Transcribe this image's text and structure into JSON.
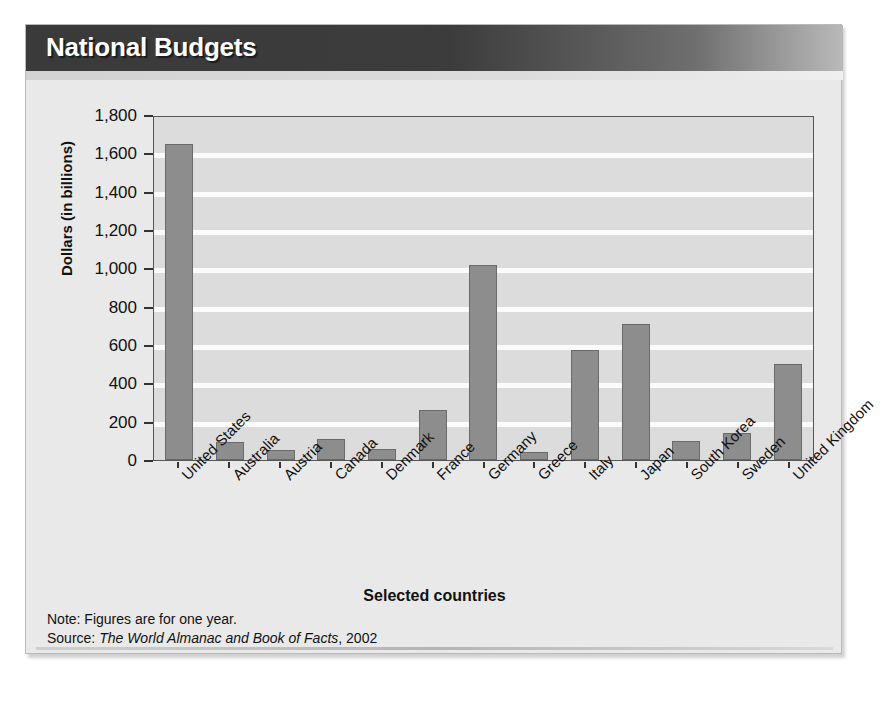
{
  "figure": {
    "title": "National Budgets",
    "notes": [
      {
        "label": "Note:",
        "text": "Figures are for one year."
      }
    ],
    "source": {
      "label": "Source:",
      "italic_title": "The World Almanac and Book of Facts",
      "year": ", 2002"
    },
    "colors": {
      "bar_fill": "#8d8d8d",
      "bar_edge": "#6a6a6a",
      "plot_background": "#dcdcdc",
      "gridline": "#fbfbfb",
      "title_bar_dark": "#3a3a3a",
      "title_bar_light": "#b9b9b9",
      "figure_background": "#e9e9e9"
    }
  },
  "chart_data": {
    "type": "bar",
    "title": "National Budgets",
    "xlabel": "Selected countries",
    "ylabel": "Dollars (in billions)",
    "categories": [
      "United States",
      "Australia",
      "Austria",
      "Canada",
      "Denmark",
      "France",
      "Germany",
      "Greece",
      "Italy",
      "Japan",
      "South Korea",
      "Sweden",
      "United Kingdom"
    ],
    "values": [
      1650,
      95,
      50,
      110,
      60,
      260,
      1020,
      40,
      575,
      710,
      100,
      140,
      500
    ],
    "ylim": [
      0,
      1800
    ],
    "ytick_values": [
      0,
      200,
      400,
      600,
      800,
      1000,
      1200,
      1400,
      1600,
      1800
    ],
    "ytick_labels": [
      "0",
      "200",
      "400",
      "600",
      "800",
      "1,000",
      "1,200",
      "1,400",
      "1,600",
      "1,800"
    ],
    "grid": true,
    "legend": false
  }
}
